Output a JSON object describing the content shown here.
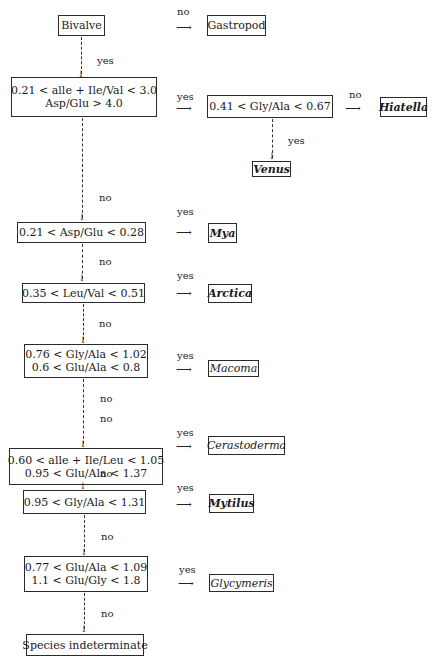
{
  "diagram": {
    "type": "decision-tree",
    "nodes": {
      "bivalve": {
        "lines": [
          "Bivalve"
        ]
      },
      "gastropod": {
        "lines": [
          "Gastropod"
        ]
      },
      "cond1": {
        "lines": [
          "0.21 < alle + Ile/Val < 3.0",
          "Asp/Glu > 4.0"
        ]
      },
      "cond1b": {
        "lines": [
          "0.41 < Gly/Ala < 0.67"
        ]
      },
      "hiatella": {
        "lines": [
          "Hiatella"
        ]
      },
      "venus": {
        "lines": [
          "Venus"
        ]
      },
      "cond2": {
        "lines": [
          "0.21 < Asp/Glu < 0.28"
        ]
      },
      "mya": {
        "lines": [
          "Mya"
        ]
      },
      "cond3": {
        "lines": [
          "0.35 < Leu/Val < 0.51"
        ]
      },
      "arctica": {
        "lines": [
          "Arctica"
        ]
      },
      "cond4": {
        "lines": [
          "0.76 < Gly/Ala < 1.02",
          "0.6 < Glu/Ala < 0.8"
        ]
      },
      "macoma": {
        "lines": [
          "Macoma"
        ]
      },
      "cond5": {
        "lines": [
          "0.60 < alle + Ile/Leu < 1.05",
          "0.95 < Glu/Ala < 1.37"
        ]
      },
      "cerastoderma": {
        "lines": [
          "Cerastoderma"
        ]
      },
      "cond6": {
        "lines": [
          "0.95 < Gly/Ala < 1.31"
        ]
      },
      "mytilus": {
        "lines": [
          "Mytilus"
        ]
      },
      "cond7": {
        "lines": [
          "0.77 < Glu/Ala < 1.09",
          "1.1 < Glu/Gly < 1.8"
        ]
      },
      "glycymeris": {
        "lines": [
          "Glycymeris"
        ]
      },
      "indeterminate": {
        "lines": [
          "Species indeterminate"
        ]
      }
    },
    "edges": [
      {
        "from": "bivalve",
        "to": "gastropod",
        "label": "no"
      },
      {
        "from": "bivalve",
        "to": "cond1",
        "label": "yes"
      },
      {
        "from": "cond1",
        "to": "cond1b",
        "label": "yes"
      },
      {
        "from": "cond1b",
        "to": "hiatella",
        "label": "no"
      },
      {
        "from": "cond1b",
        "to": "venus",
        "label": "yes"
      },
      {
        "from": "cond1",
        "to": "cond2",
        "label": "no"
      },
      {
        "from": "cond2",
        "to": "mya",
        "label": "yes"
      },
      {
        "from": "cond2",
        "to": "cond3",
        "label": "no"
      },
      {
        "from": "cond3",
        "to": "arctica",
        "label": "yes"
      },
      {
        "from": "cond3",
        "to": "cond4",
        "label": "no"
      },
      {
        "from": "cond4",
        "to": "macoma",
        "label": "yes"
      },
      {
        "from": "cond4",
        "to": "cond5",
        "label": "no"
      },
      {
        "from": "cond5",
        "to": "cerastoderma",
        "label": "yes"
      },
      {
        "from": "cond5",
        "to": "cond6",
        "label": "no"
      },
      {
        "from": "cond6",
        "to": "mytilus",
        "label": "yes"
      },
      {
        "from": "cond6",
        "to": "cond7",
        "label": "no"
      },
      {
        "from": "cond7",
        "to": "glycymeris",
        "label": "yes"
      },
      {
        "from": "cond7",
        "to": "indeterminate",
        "label": "no"
      }
    ],
    "labels": {
      "yes": "yes",
      "no": "no"
    },
    "arrow_right": "⟶",
    "arrow_down": "↓"
  }
}
